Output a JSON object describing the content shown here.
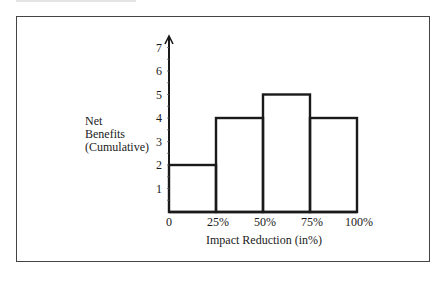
{
  "chart_data": {
    "type": "bar",
    "title": "",
    "xlabel": "Impact Reduction (in%)",
    "ylabel": "Net Benefits (Cumulative)",
    "ylabel_lines": [
      "Net",
      "Benefits",
      "(Cumulative)"
    ],
    "x_ticks": [
      "0",
      "25%",
      "50%",
      "75%",
      "100%"
    ],
    "y_ticks": [
      "1",
      "2",
      "3",
      "4",
      "5",
      "6",
      "7"
    ],
    "categories": [
      "0-25%",
      "25-50%",
      "50-75%",
      "75-100%"
    ],
    "values": [
      2,
      4,
      5,
      4
    ],
    "ylim": [
      0,
      7
    ],
    "grid": false,
    "legend": null,
    "style": "histogram, unfilled bars with thick black outlines"
  }
}
